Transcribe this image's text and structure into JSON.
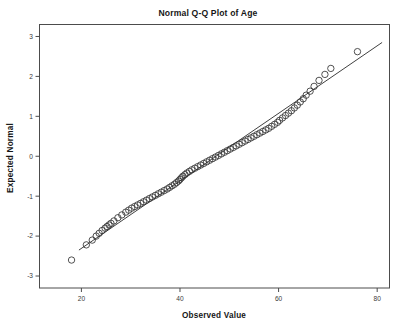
{
  "figure": {
    "title": "Normal Q-Q Plot of Age",
    "background_color": "#ffffff",
    "frame_color": "#4c4c4c",
    "marker_color": "#333333",
    "line_color": "#2a2a2a"
  },
  "axes": {
    "x_title": "Observed Value",
    "y_title": "Expected Normal",
    "x_ticks": [
      "20",
      "40",
      "60",
      "80"
    ],
    "y_ticks": [
      "3",
      "2",
      "1",
      "0",
      "-1",
      "-2",
      "-3"
    ]
  },
  "chart_data": {
    "type": "scatter",
    "title": "Normal Q-Q Plot of Age",
    "xlabel": "Observed Value",
    "ylabel": "Expected Normal",
    "xlim": [
      11.5,
      82.5
    ],
    "ylim": [
      -3.3,
      3.3
    ],
    "x_ticks": [
      20,
      40,
      60,
      80
    ],
    "y_ticks": [
      3,
      2,
      1,
      0,
      -1,
      -2,
      -3
    ],
    "grid": false,
    "legend": false,
    "marker": "open-circle",
    "marker_size": 3.2,
    "series": [
      {
        "name": "Age quantiles",
        "x": [
          18.0,
          21.0,
          22.2,
          23.0,
          23.6,
          24.2,
          24.8,
          25.2,
          25.6,
          26.0,
          26.6,
          27.4,
          28.2,
          29.0,
          29.6,
          30.2,
          30.8,
          31.4,
          32.0,
          32.6,
          33.2,
          33.8,
          34.4,
          35.0,
          35.6,
          36.2,
          36.8,
          37.4,
          37.9,
          38.4,
          38.9,
          39.3,
          39.7,
          40.0,
          40.3,
          40.6,
          41.0,
          41.4,
          41.9,
          42.4,
          43.0,
          43.6,
          44.2,
          44.8,
          45.4,
          46.0,
          46.6,
          47.2,
          47.8,
          48.4,
          49.0,
          49.6,
          50.2,
          50.8,
          51.4,
          52.0,
          52.6,
          53.2,
          53.8,
          54.4,
          55.0,
          55.6,
          56.2,
          56.8,
          57.4,
          58.0,
          58.6,
          59.2,
          59.8,
          60.2,
          60.8,
          61.4,
          62.0,
          62.6,
          63.2,
          63.8,
          64.4,
          65.0,
          65.6,
          66.4,
          67.2,
          68.2,
          69.4,
          70.6,
          76.0
        ],
        "y": [
          -2.6,
          -2.22,
          -2.1,
          -2.0,
          -1.93,
          -1.86,
          -1.8,
          -1.76,
          -1.72,
          -1.68,
          -1.62,
          -1.54,
          -1.47,
          -1.4,
          -1.35,
          -1.3,
          -1.26,
          -1.22,
          -1.18,
          -1.14,
          -1.1,
          -1.06,
          -1.02,
          -0.98,
          -0.94,
          -0.9,
          -0.86,
          -0.82,
          -0.78,
          -0.74,
          -0.7,
          -0.66,
          -0.62,
          -0.58,
          -0.54,
          -0.5,
          -0.46,
          -0.42,
          -0.38,
          -0.34,
          -0.3,
          -0.26,
          -0.22,
          -0.18,
          -0.14,
          -0.1,
          -0.06,
          -0.02,
          0.02,
          0.06,
          0.1,
          0.14,
          0.18,
          0.22,
          0.26,
          0.3,
          0.34,
          0.38,
          0.42,
          0.46,
          0.5,
          0.54,
          0.58,
          0.62,
          0.66,
          0.7,
          0.75,
          0.8,
          0.85,
          0.9,
          0.96,
          1.02,
          1.08,
          1.14,
          1.21,
          1.28,
          1.36,
          1.44,
          1.53,
          1.63,
          1.75,
          1.9,
          2.05,
          2.2,
          2.62
        ]
      }
    ],
    "reference_line": {
      "name": "Normal reference line",
      "x_start": 19.5,
      "y_start": -2.35,
      "x_end": 81.0,
      "y_end": 2.85
    }
  }
}
